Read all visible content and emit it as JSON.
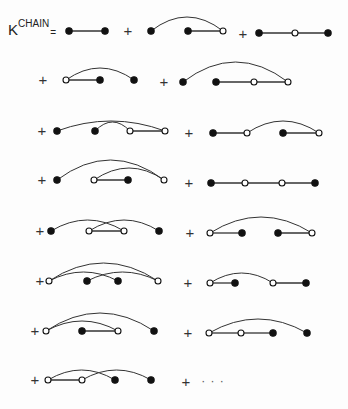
{
  "equation": {
    "lhs_base": "K",
    "lhs_superscript": "CHAIN",
    "equals": "=",
    "plus": "+",
    "ellipsis": "· · ·"
  },
  "style": {
    "stroke": "#333333",
    "filled": "#111111",
    "open_fill": "#ffffff"
  },
  "diagrams": [
    {
      "id": "D1",
      "y": 31,
      "nodes": [
        [
          69,
          "f"
        ],
        [
          105,
          "f"
        ]
      ],
      "lines": [
        [
          0,
          1
        ]
      ],
      "arcs": []
    },
    {
      "id": "D2",
      "y": 31,
      "nodes": [
        [
          151,
          "f"
        ],
        [
          188,
          "f"
        ],
        [
          223,
          "o"
        ]
      ],
      "lines": [
        [
          1,
          2
        ]
      ],
      "arcs": [
        [
          0,
          2,
          14
        ]
      ]
    },
    {
      "id": "D3",
      "y": 33,
      "nodes": [
        [
          259,
          "f"
        ],
        [
          295,
          "o"
        ],
        [
          328,
          "f"
        ]
      ],
      "lines": [
        [
          0,
          1
        ],
        [
          1,
          2
        ]
      ],
      "arcs": []
    },
    {
      "id": "D4",
      "y": 80,
      "nodes": [
        [
          66,
          "o"
        ],
        [
          100,
          "f"
        ],
        [
          134,
          "f"
        ]
      ],
      "lines": [
        [
          0,
          1
        ]
      ],
      "arcs": [
        [
          0,
          2,
          12
        ]
      ]
    },
    {
      "id": "D5",
      "y": 82,
      "nodes": [
        [
          183,
          "f"
        ],
        [
          216,
          "f"
        ],
        [
          254,
          "o"
        ],
        [
          288,
          "o"
        ]
      ],
      "lines": [
        [
          1,
          2
        ],
        [
          2,
          3
        ]
      ],
      "arcs": [
        [
          0,
          3,
          20
        ]
      ]
    },
    {
      "id": "D6",
      "y": 131,
      "nodes": [
        [
          57,
          "f"
        ],
        [
          95,
          "f"
        ],
        [
          130,
          "o"
        ],
        [
          165,
          "o"
        ]
      ],
      "lines": [
        [
          2,
          3
        ]
      ],
      "arcs": [
        [
          0,
          3,
          10
        ],
        [
          1,
          2,
          9
        ]
      ]
    },
    {
      "id": "D7",
      "y": 133,
      "nodes": [
        [
          213,
          "f"
        ],
        [
          247,
          "o"
        ],
        [
          283,
          "f"
        ],
        [
          319,
          "o"
        ]
      ],
      "lines": [
        [
          0,
          1
        ],
        [
          2,
          3
        ]
      ],
      "arcs": [
        [
          1,
          3,
          12
        ]
      ]
    },
    {
      "id": "D8",
      "y": 180,
      "nodes": [
        [
          57,
          "f"
        ],
        [
          94,
          "o"
        ],
        [
          128,
          "f"
        ],
        [
          164,
          "o"
        ]
      ],
      "lines": [
        [
          1,
          2
        ]
      ],
      "arcs": [
        [
          0,
          3,
          20
        ],
        [
          1,
          3,
          12
        ]
      ]
    },
    {
      "id": "D9",
      "y": 183,
      "nodes": [
        [
          211,
          "f"
        ],
        [
          245,
          "o"
        ],
        [
          282,
          "o"
        ],
        [
          315,
          "f"
        ]
      ],
      "lines": [
        [
          0,
          1
        ],
        [
          1,
          2
        ],
        [
          2,
          3
        ]
      ],
      "arcs": []
    },
    {
      "id": "D10",
      "y": 231,
      "nodes": [
        [
          51,
          "f"
        ],
        [
          89,
          "o"
        ],
        [
          124,
          "o"
        ],
        [
          159,
          "f"
        ]
      ],
      "lines": [
        [
          1,
          2
        ]
      ],
      "arcs": [
        [
          0,
          2,
          11
        ],
        [
          1,
          3,
          11
        ]
      ]
    },
    {
      "id": "D11",
      "y": 233,
      "nodes": [
        [
          210,
          "o"
        ],
        [
          242,
          "f"
        ],
        [
          278,
          "f"
        ],
        [
          312,
          "o"
        ]
      ],
      "lines": [
        [
          0,
          1
        ],
        [
          2,
          3
        ]
      ],
      "arcs": [
        [
          0,
          3,
          16
        ]
      ]
    },
    {
      "id": "D12",
      "y": 281,
      "nodes": [
        [
          49,
          "o"
        ],
        [
          87,
          "f"
        ],
        [
          118,
          "f"
        ],
        [
          158,
          "o"
        ]
      ],
      "lines": [],
      "arcs": [
        [
          0,
          3,
          18
        ],
        [
          0,
          2,
          9
        ],
        [
          1,
          3,
          9
        ]
      ]
    },
    {
      "id": "D13",
      "y": 283,
      "nodes": [
        [
          210,
          "o"
        ],
        [
          235,
          "f"
        ],
        [
          273,
          "o"
        ],
        [
          306,
          "f"
        ]
      ],
      "lines": [
        [
          0,
          1
        ],
        [
          2,
          3
        ]
      ],
      "arcs": [
        [
          0,
          2,
          10
        ]
      ]
    },
    {
      "id": "D14",
      "y": 331,
      "nodes": [
        [
          46,
          "o"
        ],
        [
          82,
          "f"
        ],
        [
          118,
          "o"
        ],
        [
          154,
          "f"
        ]
      ],
      "lines": [
        [
          1,
          2
        ]
      ],
      "arcs": [
        [
          0,
          2,
          10
        ],
        [
          0,
          3,
          18
        ]
      ]
    },
    {
      "id": "D15",
      "y": 333,
      "nodes": [
        [
          209,
          "o"
        ],
        [
          241,
          "o"
        ],
        [
          273,
          "f"
        ],
        [
          307,
          "f"
        ]
      ],
      "lines": [
        [
          0,
          1
        ],
        [
          1,
          2
        ]
      ],
      "arcs": [
        [
          0,
          3,
          14
        ]
      ]
    },
    {
      "id": "D16",
      "y": 380,
      "nodes": [
        [
          48,
          "o"
        ],
        [
          82,
          "o"
        ],
        [
          115,
          "f"
        ],
        [
          151,
          "f"
        ]
      ],
      "lines": [
        [
          0,
          1
        ]
      ],
      "arcs": [
        [
          0,
          2,
          10
        ],
        [
          1,
          3,
          10
        ]
      ]
    }
  ],
  "plus_signs": [
    {
      "x": 128,
      "y": 31
    },
    {
      "x": 243,
      "y": 34
    },
    {
      "x": 43,
      "y": 80
    },
    {
      "x": 164,
      "y": 82
    },
    {
      "x": 42,
      "y": 131
    },
    {
      "x": 189,
      "y": 133
    },
    {
      "x": 42,
      "y": 180
    },
    {
      "x": 189,
      "y": 183
    },
    {
      "x": 40,
      "y": 231
    },
    {
      "x": 190,
      "y": 233
    },
    {
      "x": 40,
      "y": 281
    },
    {
      "x": 188,
      "y": 283
    },
    {
      "x": 35,
      "y": 331
    },
    {
      "x": 188,
      "y": 333
    },
    {
      "x": 35,
      "y": 380
    },
    {
      "x": 186,
      "y": 382
    }
  ],
  "ellipsis_pos": {
    "x": 213,
    "y": 382
  }
}
